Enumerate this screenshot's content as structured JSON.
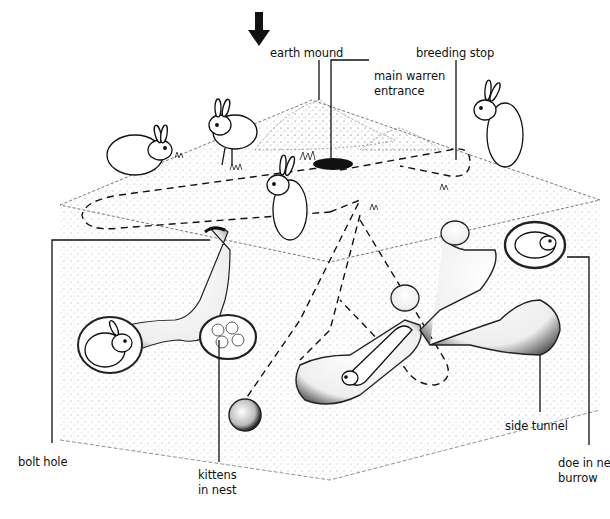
{
  "diagram": {
    "pointer_arrow": "down-arrow-icon",
    "colors": {
      "ink": "#111111",
      "background": "#ffffff",
      "stipple": "#8a8a8a"
    },
    "labels": {
      "earth_mound": "earth mound",
      "breeding_stop": "breeding stop",
      "main_warren_entrance_line1": "main warren",
      "main_warren_entrance_line2": "entrance",
      "bolt_hole": "bolt hole",
      "kittens_line1": "kittens",
      "kittens_line2": "in nest",
      "side_tunnel": "side tunnel",
      "doe_line1": "doe in ne",
      "doe_line2": "burrow"
    }
  }
}
